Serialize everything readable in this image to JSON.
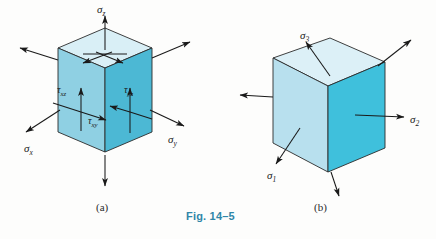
{
  "figure": {
    "caption": "Fig. 14–5",
    "caption_color": "#2f86a8",
    "background": "#fdfdfc"
  },
  "panels": [
    {
      "key": "a",
      "label": "(a)",
      "description": "General state of triaxial stress on a cubic volume element",
      "colors": {
        "top_face": "#d9eff6",
        "left_face": "#8fd0e3",
        "right_face": "#4cb8d4",
        "edge": "#2a2a2a",
        "arrow": "#1a1a1a"
      },
      "labels": [
        {
          "name": "sigma-z",
          "base": "σ",
          "sub": "z",
          "x": 97,
          "y": 4,
          "class": "sigma-lbl"
        },
        {
          "name": "sigma-x",
          "base": "σ",
          "sub": "x",
          "x": 24,
          "y": 143,
          "class": "sigma-lbl"
        },
        {
          "name": "sigma-y",
          "base": "σ",
          "sub": "y",
          "x": 168,
          "y": 134,
          "class": "sigma-lbl"
        },
        {
          "name": "tau-xz",
          "base": "τ",
          "sub": "xz",
          "x": 57,
          "y": 85,
          "class": "tau-lbl"
        },
        {
          "name": "tau-xy",
          "base": "τ",
          "sub": "xy",
          "x": 88,
          "y": 116,
          "class": "tau-lbl"
        },
        {
          "name": "tau-yz",
          "base": "τ",
          "sub": "yz",
          "x": 124,
          "y": 85,
          "class": "tau-lbl"
        }
      ]
    },
    {
      "key": "b",
      "label": "(b)",
      "description": "Principal stress state on a rotated cubic volume element",
      "colors": {
        "top_face": "#dcf0f7",
        "left_face": "#b8e0ee",
        "right_face": "#3fc0dc",
        "edge": "#2a2a2a",
        "arrow": "#1a1a1a"
      },
      "labels": [
        {
          "name": "sigma-3",
          "base": "σ",
          "sub": "3",
          "x": 300,
          "y": 30,
          "class": "sigma-lbl"
        },
        {
          "name": "sigma-2",
          "base": "σ",
          "sub": "2",
          "x": 410,
          "y": 114,
          "class": "sigma-lbl"
        },
        {
          "name": "sigma-1",
          "base": "σ",
          "sub": "1",
          "x": 267,
          "y": 170,
          "class": "sigma-lbl"
        }
      ]
    }
  ],
  "panel_label_positions": {
    "a": {
      "x": 96,
      "y": 201
    },
    "b": {
      "x": 314,
      "y": 201
    }
  },
  "caption_position": {
    "x": 186,
    "y": 210
  }
}
